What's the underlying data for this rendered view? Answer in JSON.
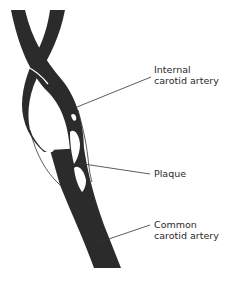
{
  "diagram": {
    "colors": {
      "vessel": "#2b2b2b",
      "background": "#ffffff",
      "leader_line": "#333333",
      "text": "#2a2a2a"
    },
    "labels": [
      {
        "id": "internal",
        "line1": "Internal",
        "line2": "carotid artery"
      },
      {
        "id": "plaque",
        "line1": "Plaque"
      },
      {
        "id": "common",
        "line1": "Common",
        "line2": "carotid artery"
      }
    ]
  }
}
